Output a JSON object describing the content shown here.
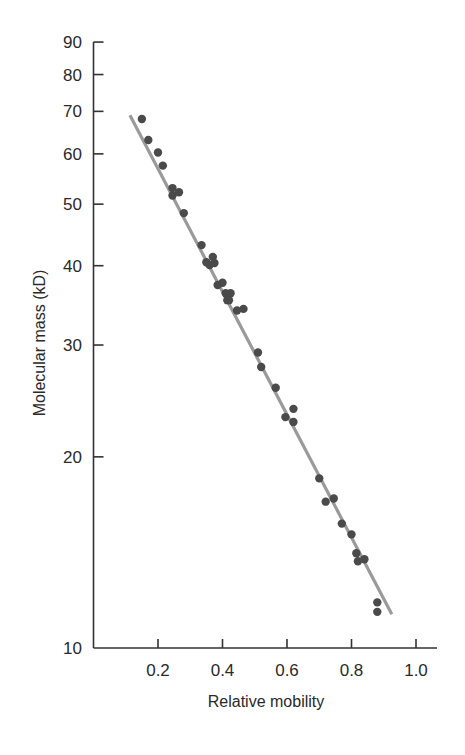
{
  "chart_data": {
    "type": "scatter",
    "title": "",
    "xlabel": "Relative mobility",
    "ylabel": "Molecular mass (kD)",
    "xlim": [
      0.0,
      1.07
    ],
    "ylim": [
      10,
      90
    ],
    "yscale": "log",
    "grid": false,
    "legend": null,
    "x_ticks": [
      0.2,
      0.4,
      0.6,
      0.8,
      1.0
    ],
    "x_tick_labels": [
      "0.2",
      "0.4",
      "0.6",
      "0.8",
      "1.0"
    ],
    "y_ticks": [
      10,
      20,
      30,
      40,
      50,
      60,
      70,
      80,
      90
    ],
    "y_tick_labels": [
      "10",
      "20",
      "30",
      "40",
      "50",
      "60",
      "70",
      "80",
      "90"
    ],
    "series": [
      {
        "name": "Proteins",
        "kind": "scatter",
        "color": "#4a4a4a",
        "points": [
          {
            "x": 0.15,
            "y": 68.1
          },
          {
            "x": 0.17,
            "y": 63.1
          },
          {
            "x": 0.2,
            "y": 60.3
          },
          {
            "x": 0.215,
            "y": 57.5
          },
          {
            "x": 0.245,
            "y": 53.0
          },
          {
            "x": 0.245,
            "y": 51.6
          },
          {
            "x": 0.265,
            "y": 52.2
          },
          {
            "x": 0.28,
            "y": 48.4
          },
          {
            "x": 0.335,
            "y": 43.1
          },
          {
            "x": 0.35,
            "y": 40.5
          },
          {
            "x": 0.36,
            "y": 40.1
          },
          {
            "x": 0.37,
            "y": 41.3
          },
          {
            "x": 0.375,
            "y": 40.4
          },
          {
            "x": 0.385,
            "y": 37.3
          },
          {
            "x": 0.4,
            "y": 37.6
          },
          {
            "x": 0.41,
            "y": 36.2
          },
          {
            "x": 0.415,
            "y": 35.3
          },
          {
            "x": 0.425,
            "y": 36.2
          },
          {
            "x": 0.42,
            "y": 35.3
          },
          {
            "x": 0.445,
            "y": 34.0
          },
          {
            "x": 0.465,
            "y": 34.2
          },
          {
            "x": 0.51,
            "y": 29.2
          },
          {
            "x": 0.52,
            "y": 27.7
          },
          {
            "x": 0.565,
            "y": 25.7
          },
          {
            "x": 0.595,
            "y": 23.1
          },
          {
            "x": 0.62,
            "y": 23.8
          },
          {
            "x": 0.62,
            "y": 22.7
          },
          {
            "x": 0.7,
            "y": 18.5
          },
          {
            "x": 0.72,
            "y": 17.0
          },
          {
            "x": 0.745,
            "y": 17.2
          },
          {
            "x": 0.77,
            "y": 15.7
          },
          {
            "x": 0.8,
            "y": 15.1
          },
          {
            "x": 0.815,
            "y": 14.1
          },
          {
            "x": 0.82,
            "y": 13.7
          },
          {
            "x": 0.84,
            "y": 13.8
          },
          {
            "x": 0.88,
            "y": 11.8
          },
          {
            "x": 0.88,
            "y": 11.4
          }
        ]
      },
      {
        "name": "Fit line",
        "kind": "line",
        "color": "#9a9a9a",
        "points": [
          {
            "x": 0.113,
            "y": 69.0
          },
          {
            "x": 0.925,
            "y": 11.3
          }
        ]
      }
    ]
  }
}
